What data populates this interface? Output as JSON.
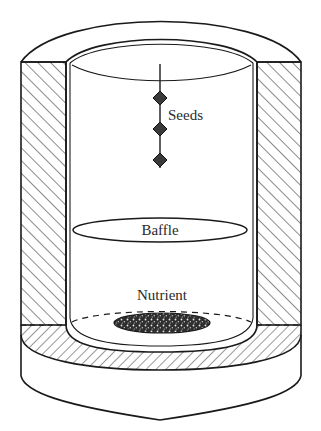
{
  "figure": {
    "type": "schematic cross-section of seed germination chamber",
    "labels": {
      "seeds": "Seeds",
      "baffle": "Baffle",
      "nutrient": "Nutrient"
    },
    "seed_count": 3,
    "colors": {
      "line": "#1a1a1a",
      "background": "#ffffff",
      "nutrient_fill": "#3a3a3a",
      "label": "#2a2a2a"
    }
  }
}
